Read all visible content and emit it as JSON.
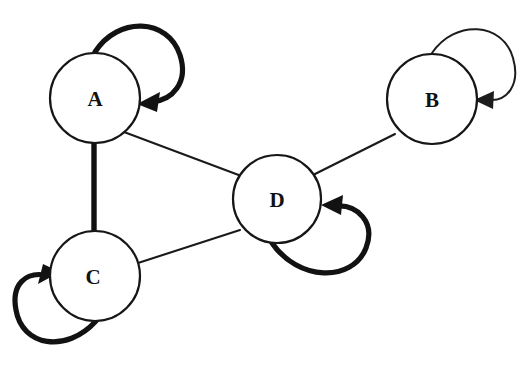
{
  "figure": {
    "name": "state-transition-graph",
    "background_color": "#ffffff",
    "ink_color": "#111111",
    "width": 523,
    "height": 373
  },
  "graph": {
    "type": "directed-graph-with-self-loops",
    "nodes": [
      {
        "id": "A",
        "label": "A",
        "cx": 95,
        "cy": 98,
        "r": 45
      },
      {
        "id": "B",
        "label": "B",
        "cx": 432,
        "cy": 99,
        "r": 45
      },
      {
        "id": "C",
        "label": "C",
        "cx": 95,
        "cy": 276,
        "r": 45
      },
      {
        "id": "D",
        "label": "D",
        "cx": 277,
        "cy": 199,
        "r": 44
      }
    ],
    "edges": [
      {
        "id": "edge-a-c",
        "from": "A",
        "to": "C",
        "weight": "thick",
        "directed": false
      },
      {
        "id": "edge-a-d",
        "from": "A",
        "to": "D",
        "weight": "thin",
        "directed": false
      },
      {
        "id": "edge-c-d",
        "from": "C",
        "to": "D",
        "weight": "thin",
        "directed": false
      },
      {
        "id": "edge-d-b",
        "from": "D",
        "to": "B",
        "weight": "thin",
        "directed": false
      }
    ],
    "self_loops": [
      {
        "id": "loop-a",
        "node": "A",
        "weight": "bold",
        "side": "top-right",
        "arrow_direction": "down-left"
      },
      {
        "id": "loop-b",
        "node": "B",
        "weight": "thin",
        "side": "top-right",
        "arrow_direction": "left"
      },
      {
        "id": "loop-c",
        "node": "C",
        "weight": "bold",
        "side": "bottom-left",
        "arrow_direction": "up-right"
      },
      {
        "id": "loop-d",
        "node": "D",
        "weight": "bold",
        "side": "bottom-right",
        "arrow_direction": "up-left"
      }
    ]
  }
}
